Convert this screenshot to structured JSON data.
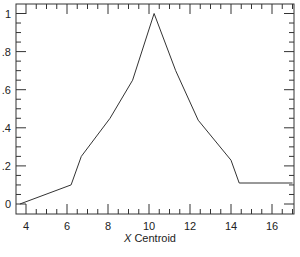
{
  "chart_data": {
    "type": "line",
    "title": "",
    "xlabel_italic": "X",
    "xlabel_rest": " Centroid",
    "xlabel": "X Centroid",
    "ylabel": "",
    "xlim": [
      3.5,
      17.05
    ],
    "ylim": [
      -0.05,
      1.05
    ],
    "x_ticks": [
      4,
      6,
      8,
      10,
      12,
      14,
      16
    ],
    "x_tick_labels": [
      "4",
      "6",
      "8",
      "10",
      "12",
      "14",
      "16"
    ],
    "y_ticks": [
      0,
      0.2,
      0.4,
      0.6,
      0.8,
      1
    ],
    "y_tick_labels": [
      "0",
      ".2",
      ".4",
      ".6",
      ".8",
      "1"
    ],
    "grid": false,
    "legend": null,
    "series": [
      {
        "name": "profile",
        "x": [
          3.7,
          6.2,
          6.7,
          8.1,
          9.2,
          10.25,
          11.3,
          12.4,
          14.0,
          14.4,
          17.0
        ],
        "y": [
          0.0,
          0.1,
          0.25,
          0.45,
          0.65,
          1.0,
          0.7,
          0.44,
          0.23,
          0.11,
          0.11
        ]
      }
    ],
    "colors": {
      "line": "#333333",
      "frame": "#333333"
    }
  }
}
